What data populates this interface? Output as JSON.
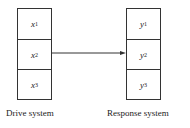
{
  "drive_system": {
    "label": "Drive system",
    "cells": [
      {
        "var": "x",
        "sub": "1"
      },
      {
        "var": "x",
        "sub": "2"
      },
      {
        "var": "x",
        "sub": "3"
      }
    ]
  },
  "response_system": {
    "label": "Response system",
    "cells": [
      {
        "var": "y",
        "sub": "1"
      },
      {
        "var": "y",
        "sub": "2"
      },
      {
        "var": "y",
        "sub": "3"
      }
    ]
  },
  "connection": {
    "from": "x2",
    "to": "y2"
  }
}
